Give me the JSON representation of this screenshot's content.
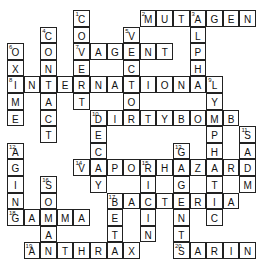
{
  "puzzle": {
    "type": "crossword",
    "solved": true,
    "grid_cols": 15,
    "grid_rows": 15,
    "words": [
      {
        "number": 1,
        "direction": "down",
        "answer": "COVERT",
        "row": 0,
        "col": 4
      },
      {
        "number": 2,
        "direction": "across",
        "answer": "MUTAGEN",
        "row": 0,
        "col": 8
      },
      {
        "number": 3,
        "direction": "down",
        "answer": "ALPHA",
        "row": 0,
        "col": 11
      },
      {
        "number": 4,
        "direction": "down",
        "answer": "CONTACT",
        "row": 1,
        "col": 2
      },
      {
        "number": 5,
        "direction": "down",
        "answer": "VECTOR",
        "row": 1,
        "col": 7
      },
      {
        "number": 6,
        "direction": "down",
        "answer": "OXIME",
        "row": 2,
        "col": 0
      },
      {
        "number": 7,
        "direction": "across",
        "answer": "VAGENT",
        "row": 2,
        "col": 4
      },
      {
        "number": 8,
        "direction": "across",
        "answer": "INTERNATIONAL",
        "row": 4,
        "col": 0
      },
      {
        "number": 9,
        "direction": "down",
        "answer": "LYMPHATIC",
        "row": 4,
        "col": 12
      },
      {
        "number": 10,
        "direction": "across",
        "answer": "DIRTYBOMB",
        "row": 6,
        "col": 5
      },
      {
        "number": 10,
        "direction": "down",
        "answer": "DECAY",
        "row": 6,
        "col": 5
      },
      {
        "number": 11,
        "direction": "down",
        "answer": "SADM",
        "row": 7,
        "col": 14
      },
      {
        "number": 12,
        "direction": "down",
        "answer": "AGING",
        "row": 8,
        "col": 0
      },
      {
        "number": 13,
        "direction": "down",
        "answer": "GAGENTS",
        "row": 8,
        "col": 10
      },
      {
        "number": 14,
        "direction": "across",
        "answer": "VAPORHAZARD",
        "row": 9,
        "col": 4
      },
      {
        "number": 15,
        "direction": "down",
        "answer": "RICIN",
        "row": 9,
        "col": 8
      },
      {
        "number": 16,
        "direction": "down",
        "answer": "SOMAN",
        "row": 10,
        "col": 2
      },
      {
        "number": 17,
        "direction": "across",
        "answer": "BACTERIA",
        "row": 11,
        "col": 6
      },
      {
        "number": 17,
        "direction": "down",
        "answer": "BETA",
        "row": 11,
        "col": 6
      },
      {
        "number": 18,
        "direction": "across",
        "answer": "GAMMA",
        "row": 12,
        "col": 0
      },
      {
        "number": 19,
        "direction": "across",
        "answer": "ANTHRAX",
        "row": 14,
        "col": 1
      },
      {
        "number": 20,
        "direction": "across",
        "answer": "SARIN",
        "row": 14,
        "col": 10
      }
    ]
  }
}
